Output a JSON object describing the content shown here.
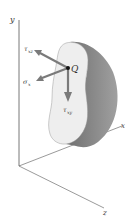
{
  "diagram": {
    "type": "stress-element-cross-section",
    "axes": {
      "x_label": "x",
      "y_label": "y",
      "z_label": "z"
    },
    "point": {
      "label": "Q"
    },
    "stress_components": [
      {
        "symbol": "τ",
        "subscript": "xz",
        "direction": "up-left"
      },
      {
        "symbol": "σ",
        "subscript": "x",
        "direction": "down-left"
      },
      {
        "symbol": "τ",
        "subscript": "xy",
        "direction": "down"
      }
    ],
    "colors": {
      "axis": "#555555",
      "arrow": "#7a7a7a",
      "face": "#ececec",
      "body_side": "#8a8a8a",
      "point": "#111111"
    }
  }
}
